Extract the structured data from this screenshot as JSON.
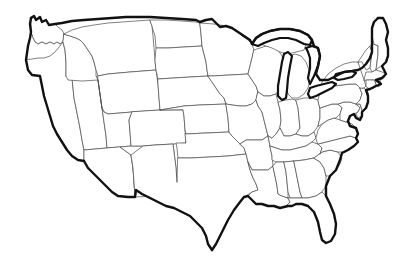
{
  "map": {
    "title": "Blank United States Outline Map",
    "region": "Contiguous United States",
    "projection": "albers-usa",
    "background_color": "#ffffff",
    "border_color": "#111111",
    "state_line_color": "#4a4a4a",
    "fill_color": "#ffffff",
    "border_width_px": 2.4,
    "state_line_width_px": 0.7,
    "labels_visible": false,
    "legend_visible": false,
    "graticule_visible": false,
    "water_features": [
      "Great Lakes",
      "Chesapeake Bay",
      "Gulf of Mexico coastline",
      "Atlantic coastline",
      "Pacific coastline"
    ],
    "states": [
      {
        "code": "WA",
        "name": "Washington"
      },
      {
        "code": "OR",
        "name": "Oregon"
      },
      {
        "code": "CA",
        "name": "California"
      },
      {
        "code": "NV",
        "name": "Nevada"
      },
      {
        "code": "ID",
        "name": "Idaho"
      },
      {
        "code": "MT",
        "name": "Montana"
      },
      {
        "code": "WY",
        "name": "Wyoming"
      },
      {
        "code": "UT",
        "name": "Utah"
      },
      {
        "code": "AZ",
        "name": "Arizona"
      },
      {
        "code": "NM",
        "name": "New Mexico"
      },
      {
        "code": "CO",
        "name": "Colorado"
      },
      {
        "code": "ND",
        "name": "North Dakota"
      },
      {
        "code": "SD",
        "name": "South Dakota"
      },
      {
        "code": "NE",
        "name": "Nebraska"
      },
      {
        "code": "KS",
        "name": "Kansas"
      },
      {
        "code": "OK",
        "name": "Oklahoma"
      },
      {
        "code": "TX",
        "name": "Texas"
      },
      {
        "code": "MN",
        "name": "Minnesota"
      },
      {
        "code": "IA",
        "name": "Iowa"
      },
      {
        "code": "MO",
        "name": "Missouri"
      },
      {
        "code": "AR",
        "name": "Arkansas"
      },
      {
        "code": "LA",
        "name": "Louisiana"
      },
      {
        "code": "WI",
        "name": "Wisconsin"
      },
      {
        "code": "IL",
        "name": "Illinois"
      },
      {
        "code": "MI",
        "name": "Michigan"
      },
      {
        "code": "IN",
        "name": "Indiana"
      },
      {
        "code": "OH",
        "name": "Ohio"
      },
      {
        "code": "KY",
        "name": "Kentucky"
      },
      {
        "code": "TN",
        "name": "Tennessee"
      },
      {
        "code": "MS",
        "name": "Mississippi"
      },
      {
        "code": "AL",
        "name": "Alabama"
      },
      {
        "code": "GA",
        "name": "Georgia"
      },
      {
        "code": "FL",
        "name": "Florida"
      },
      {
        "code": "SC",
        "name": "South Carolina"
      },
      {
        "code": "NC",
        "name": "North Carolina"
      },
      {
        "code": "VA",
        "name": "Virginia"
      },
      {
        "code": "WV",
        "name": "West Virginia"
      },
      {
        "code": "MD",
        "name": "Maryland"
      },
      {
        "code": "DE",
        "name": "Delaware"
      },
      {
        "code": "PA",
        "name": "Pennsylvania"
      },
      {
        "code": "NJ",
        "name": "New Jersey"
      },
      {
        "code": "NY",
        "name": "New York"
      },
      {
        "code": "CT",
        "name": "Connecticut"
      },
      {
        "code": "RI",
        "name": "Rhode Island"
      },
      {
        "code": "MA",
        "name": "Massachusetts"
      },
      {
        "code": "VT",
        "name": "Vermont"
      },
      {
        "code": "NH",
        "name": "New Hampshire"
      },
      {
        "code": "ME",
        "name": "Maine"
      }
    ]
  }
}
